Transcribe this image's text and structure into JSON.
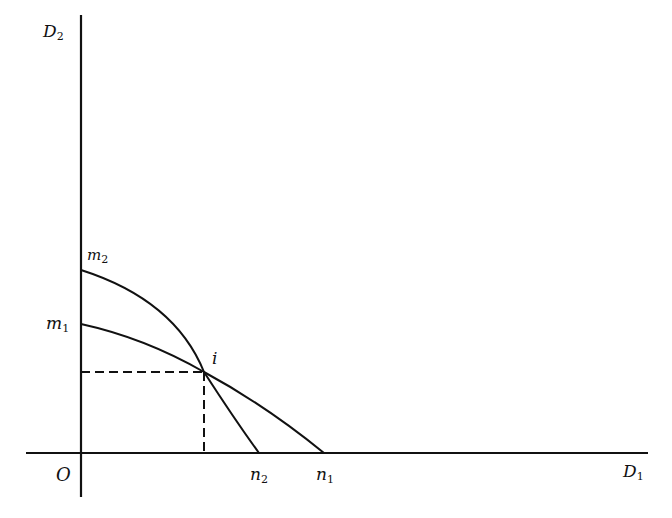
{
  "diagram": {
    "axes": {
      "y_label": {
        "base": "D",
        "sub": "2"
      },
      "x_label": {
        "base": "D",
        "sub": "1"
      },
      "origin_label": "O"
    },
    "points": {
      "m2": {
        "base": "m",
        "sub": "2"
      },
      "m1": {
        "base": "m",
        "sub": "1"
      },
      "i": "i",
      "n2": {
        "base": "n",
        "sub": "2"
      },
      "n1": {
        "base": "n",
        "sub": "1"
      }
    },
    "curves": [
      {
        "name": "m2-n2",
        "from": "m2",
        "to": "n2",
        "shape": "concave"
      },
      {
        "name": "m1-n1",
        "from": "m1",
        "to": "n1",
        "shape": "slightly concave"
      }
    ],
    "intersection": "i",
    "dashed_projections": [
      "horizontal to D2 axis",
      "vertical to D1 axis"
    ]
  }
}
